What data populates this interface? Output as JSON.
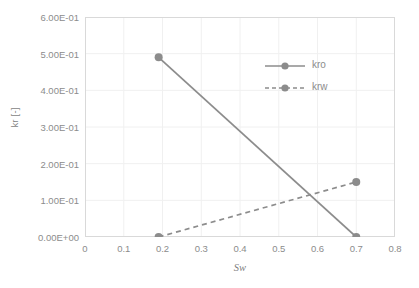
{
  "chart_data": {
    "type": "line",
    "title": "",
    "xlabel": "Sw",
    "ylabel": "kr [-]",
    "xlim": [
      0,
      0.8
    ],
    "ylim": [
      0,
      0.6
    ],
    "grid": true,
    "legend_position": "inside-upper-right",
    "x_ticks": [
      "0",
      "0.1",
      "0.2",
      "0.3",
      "0.4",
      "0.5",
      "0.6",
      "0.7",
      "0.8"
    ],
    "x_tick_values": [
      0,
      0.1,
      0.2,
      0.3,
      0.4,
      0.5,
      0.6,
      0.7,
      0.8
    ],
    "y_ticks": [
      "0.00E+00",
      "1.00E-01",
      "2.00E-01",
      "3.00E-01",
      "4.00E-01",
      "5.00E-01",
      "6.00E-01"
    ],
    "y_tick_values": [
      0,
      0.1,
      0.2,
      0.3,
      0.4,
      0.5,
      0.6
    ],
    "series": [
      {
        "name": "kro",
        "style": "solid",
        "color": "#8c8c8c",
        "marker": "circle",
        "x": [
          0.19,
          0.7
        ],
        "values": [
          0.49,
          0.0
        ]
      },
      {
        "name": "krw",
        "style": "dashed",
        "color": "#8c8c8c",
        "marker": "circle",
        "x": [
          0.19,
          0.7
        ],
        "values": [
          0.0,
          0.15
        ]
      }
    ]
  },
  "legend": {
    "entries": [
      {
        "label": "kro"
      },
      {
        "label": "krw"
      }
    ]
  },
  "colors": {
    "line": "#8c8c8c",
    "grid": "#f0f0f0",
    "axis": "#d9d9d9",
    "text": "#8c8c8c",
    "background": "#ffffff"
  }
}
